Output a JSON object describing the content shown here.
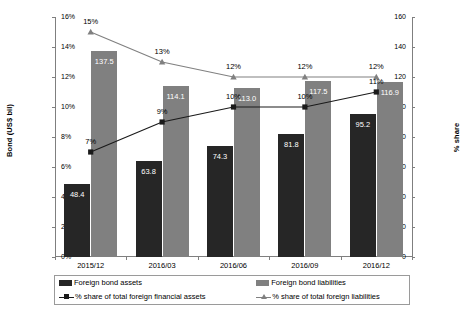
{
  "chart_data": {
    "type": "bar",
    "title": "",
    "subtitle": "",
    "xlabel": "",
    "ylabel": "Bond (US$ bil)",
    "y2label": "% share",
    "ylim": [
      0,
      160
    ],
    "y2lim": [
      0,
      16
    ],
    "grid": false,
    "legend_position": "bottom",
    "categories": [
      "2015/12",
      "2016/03",
      "2016/06",
      "2016/09",
      "2016/12"
    ],
    "y_ticks": [
      "0",
      "20",
      "40",
      "60",
      "80",
      "100",
      "120",
      "140",
      "160"
    ],
    "y2_ticks": [
      "0%",
      "2%",
      "4%",
      "6%",
      "8%",
      "10%",
      "12%",
      "14%",
      "16%"
    ],
    "series": [
      {
        "name": "Foreign bond assets",
        "kind": "bar",
        "axis": "left",
        "color": "#262626",
        "values": [
          48.4,
          63.8,
          74.3,
          81.8,
          95.2
        ],
        "labels": [
          "48.4",
          "63.8",
          "74.3",
          "81.8",
          "95.2"
        ]
      },
      {
        "name": "Foreign bond liabilities",
        "kind": "bar",
        "axis": "left",
        "color": "#808080",
        "values": [
          137.5,
          114.1,
          113.0,
          117.5,
          116.9
        ],
        "labels": [
          "137.5",
          "114.1",
          "113.0",
          "117.5",
          "116.9"
        ]
      },
      {
        "name": "% share of total foreign financial assets",
        "kind": "line",
        "axis": "right",
        "color": "#1a1a1a",
        "marker": "square",
        "values": [
          7,
          9,
          10,
          10,
          11
        ],
        "labels": [
          "7%",
          "9%",
          "10%",
          "10%",
          "11%"
        ]
      },
      {
        "name": "% share of total foreign liabilities",
        "kind": "line",
        "axis": "right",
        "color": "#808080",
        "marker": "triangle",
        "values": [
          15,
          13,
          12,
          12,
          12
        ],
        "labels": [
          "15%",
          "13%",
          "12%",
          "12%",
          "12%"
        ]
      }
    ]
  },
  "legend": {
    "items": [
      {
        "label": "Foreign bond assets"
      },
      {
        "label": "Foreign bond liabilities"
      },
      {
        "label": "% share of total foreign financial assets"
      },
      {
        "label": "% share of total foreign liabilities"
      }
    ]
  }
}
